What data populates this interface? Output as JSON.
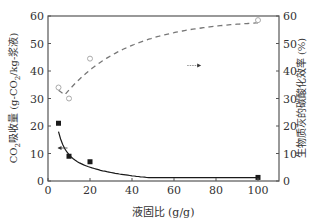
{
  "chart_data": {
    "type": "line",
    "title": "",
    "xlabel": "液固比 (g/g)",
    "ylabel": "CO2吸收量 (g-CO2/kg-浆液)",
    "ylabel_parts": {
      "pre": "CO",
      "sub": "2",
      "mid": "吸收量 (g-CO",
      "sub2": "2",
      "post": "/kg-浆液)"
    },
    "y2label": "生物质灰的碳酸化效率 (%)",
    "xlim": [
      0,
      110
    ],
    "ylim": [
      0,
      60
    ],
    "y2lim": [
      0,
      60
    ],
    "xticks": [
      0,
      20,
      40,
      60,
      80,
      100
    ],
    "yticks": [
      0,
      10,
      20,
      30,
      40,
      50,
      60
    ],
    "y2ticks": [
      0,
      10,
      20,
      30,
      40,
      50,
      60
    ],
    "grid": false,
    "legend": "none; arrows indicate axis assignment",
    "series": [
      {
        "name": "CO2吸收量",
        "axis": "left",
        "marker": "filled-square",
        "line": "solid fitted curve",
        "color": "#1a1a1a",
        "x": [
          5,
          10,
          20,
          100
        ],
        "values": [
          21,
          9,
          7,
          1.3
        ]
      },
      {
        "name": "生物质灰的碳酸化效率",
        "axis": "right",
        "marker": "open-circle",
        "line": "dashed fitted curve",
        "color": "#999999",
        "x": [
          5,
          10,
          20,
          100
        ],
        "values": [
          34,
          30,
          44.5,
          58.5
        ]
      }
    ],
    "annotations": [
      {
        "text": "←",
        "points_to": "left axis",
        "x": 5,
        "y": 12
      },
      {
        "text": "→",
        "points_to": "right axis",
        "x": 72,
        "y": 42
      }
    ]
  }
}
